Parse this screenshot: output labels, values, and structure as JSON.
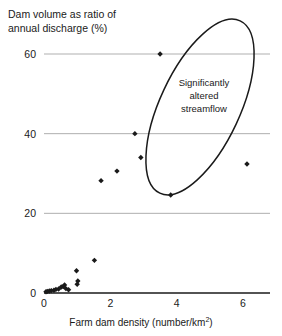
{
  "chart_data": {
    "type": "scatter",
    "title": "Dam volume as ratio of annual discharge (%)",
    "title_lines": [
      "Dam volume as ratio of",
      "annual discharge (%)"
    ],
    "xlabel": "Farm dam density (number/km²)",
    "xlabel_main": "Farm dam density (number/km",
    "xlabel_sup": "2",
    "xlabel_tail": ")",
    "ylabel": "Dam volume as ratio of annual discharge (%)",
    "xlim": [
      0,
      6.8
    ],
    "ylim": [
      0,
      66
    ],
    "xticks": [
      "0",
      "2",
      "4",
      "6"
    ],
    "xtick_values": [
      0,
      2,
      4,
      6
    ],
    "yticks": [
      "0",
      "20",
      "40",
      "60"
    ],
    "ytick_values": [
      0,
      20,
      40,
      60
    ],
    "grid": true,
    "grid_color": "#a6a6a6",
    "marker_color": "#1a1a1a",
    "marker": "diamond",
    "legend": "none",
    "points": [
      {
        "x": 3.5,
        "y": 60.0
      },
      {
        "x": 2.74,
        "y": 40.0
      },
      {
        "x": 2.92,
        "y": 34.0
      },
      {
        "x": 6.12,
        "y": 32.4
      },
      {
        "x": 2.2,
        "y": 30.6
      },
      {
        "x": 1.72,
        "y": 28.2
      },
      {
        "x": 3.82,
        "y": 24.6
      },
      {
        "x": 1.52,
        "y": 8.2
      },
      {
        "x": 0.98,
        "y": 5.6
      },
      {
        "x": 1.02,
        "y": 3.0
      },
      {
        "x": 1.0,
        "y": 2.2
      },
      {
        "x": 0.62,
        "y": 2.0
      },
      {
        "x": 0.58,
        "y": 1.6
      },
      {
        "x": 0.52,
        "y": 1.5
      },
      {
        "x": 0.66,
        "y": 1.1
      },
      {
        "x": 0.44,
        "y": 1.0
      },
      {
        "x": 0.36,
        "y": 0.9
      },
      {
        "x": 0.74,
        "y": 0.8
      },
      {
        "x": 0.3,
        "y": 0.7
      },
      {
        "x": 0.22,
        "y": 0.6
      },
      {
        "x": 0.16,
        "y": 0.5
      },
      {
        "x": 0.1,
        "y": 0.4
      },
      {
        "x": 0.06,
        "y": 0.3
      }
    ],
    "annotations": [
      {
        "text": "Significantly altered streamflow",
        "lines": [
          "Significantly",
          "altered",
          "streamflow"
        ],
        "shape": "ellipse",
        "ellipse_cx": 200,
        "ellipse_cy": 107,
        "ellipse_rx": 40,
        "ellipse_ry": 95,
        "ellipse_rotation": 25
      }
    ]
  }
}
